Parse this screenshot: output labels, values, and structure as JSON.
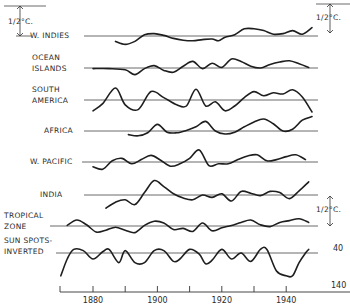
{
  "chart_data": {
    "type": "line",
    "title": "",
    "xlabel": "",
    "ylabel": "",
    "xlim": [
      1870,
      1960
    ],
    "x_ticks": [
      1880,
      1890,
      1900,
      1910,
      1920,
      1930,
      1940
    ],
    "x_tick_labels": [
      "1880",
      "1900",
      "1920",
      "1940"
    ],
    "scale_annotations": [
      {
        "text": "1/2°C.",
        "position": "top-left"
      },
      {
        "text": "1/2°C.",
        "position": "top-right"
      },
      {
        "text": "1/2°C.",
        "position": "right-lower"
      }
    ],
    "sunspot_scale": {
      "top_label": "40",
      "bottom_label": "140"
    },
    "units_per_half_degree": 1,
    "series": [
      {
        "name": "W. INDIES",
        "label_lines": [
          "W. INDIES"
        ],
        "x": [
          1887,
          1890,
          1893,
          1896,
          1899,
          1902,
          1905,
          1908,
          1911,
          1914,
          1917,
          1919,
          1921,
          1924,
          1927,
          1930,
          1933,
          1936,
          1939,
          1942,
          1945,
          1948
        ],
        "values": [
          -0.45,
          -0.7,
          -0.45,
          0.1,
          0.2,
          0.05,
          -0.2,
          -0.35,
          -0.4,
          -0.3,
          -0.25,
          -0.4,
          -0.1,
          0.1,
          0.6,
          0.6,
          0.45,
          0.15,
          0.2,
          0.45,
          0.15,
          0.7
        ]
      },
      {
        "name": "OCEAN ISLANDS",
        "label_lines": [
          "OCEAN",
          "ISLANDS"
        ],
        "x": [
          1880,
          1885,
          1890,
          1893,
          1896,
          1899,
          1902,
          1905,
          1908,
          1911,
          1914,
          1917,
          1920,
          1923,
          1926,
          1929,
          1932,
          1935,
          1938,
          1941,
          1944,
          1947
        ],
        "values": [
          -0.05,
          -0.05,
          -0.15,
          -0.55,
          -0.05,
          0.2,
          -0.2,
          -0.35,
          0.15,
          0.55,
          -0.05,
          0.4,
          0.05,
          0.75,
          0.55,
          0.15,
          0.0,
          0.3,
          0.5,
          0.6,
          0.35,
          0.05
        ]
      },
      {
        "name": "SOUTH AMERICA",
        "label_lines": [
          "SOUTH",
          "AMERICA"
        ],
        "x": [
          1880,
          1883,
          1887,
          1890,
          1894,
          1898,
          1902,
          1906,
          1909,
          1912,
          1915,
          1918,
          1921,
          1924,
          1927,
          1930,
          1933,
          1936,
          1939,
          1942,
          1945,
          1948
        ],
        "values": [
          -0.9,
          -0.3,
          1.0,
          -0.4,
          -0.8,
          0.7,
          0.2,
          -0.4,
          -0.5,
          0.9,
          -0.5,
          -0.15,
          -0.9,
          -0.5,
          0.2,
          0.7,
          0.35,
          0.6,
          0.5,
          0.85,
          0.25,
          -1.0
        ]
      },
      {
        "name": "AFRICA",
        "label_lines": [
          "AFRICA"
        ],
        "x": [
          1891,
          1894,
          1897,
          1900,
          1903,
          1906,
          1909,
          1912,
          1915,
          1918,
          1921,
          1924,
          1927,
          1930,
          1933,
          1936,
          1939,
          1942,
          1945,
          1948
        ],
        "values": [
          -0.3,
          -0.4,
          -0.15,
          0.55,
          -0.1,
          -0.15,
          0.05,
          0.35,
          0.8,
          0.0,
          -0.25,
          -0.1,
          0.35,
          0.75,
          1.0,
          0.6,
          0.0,
          0.15,
          0.9,
          1.2
        ]
      },
      {
        "name": "W. PACIFIC",
        "label_lines": [
          "W. PACIFIC"
        ],
        "x": [
          1880,
          1883,
          1886,
          1889,
          1892,
          1895,
          1898,
          1901,
          1904,
          1907,
          1910,
          1913,
          1916,
          1919,
          1922,
          1925,
          1928,
          1931,
          1934,
          1937,
          1940,
          1943,
          1946
        ],
        "values": [
          -0.4,
          -0.6,
          0.1,
          0.3,
          -0.15,
          0.2,
          0.55,
          0.15,
          -0.35,
          -0.15,
          0.3,
          1.0,
          -0.3,
          -0.15,
          -0.15,
          0.2,
          0.5,
          0.6,
          0.1,
          0.2,
          0.45,
          0.6,
          0.2
        ]
      },
      {
        "name": "INDIA",
        "label_lines": [
          "INDIA"
        ],
        "x": [
          1884,
          1887,
          1890,
          1893,
          1896,
          1899,
          1902,
          1905,
          1908,
          1911,
          1914,
          1917,
          1920,
          1923,
          1926,
          1929,
          1932,
          1935,
          1938,
          1941,
          1944,
          1947
        ],
        "values": [
          -1.1,
          -0.6,
          -0.4,
          -0.8,
          0.2,
          1.2,
          0.7,
          0.1,
          -0.25,
          -0.4,
          0.0,
          -0.2,
          0.1,
          -0.5,
          0.3,
          0.15,
          -0.05,
          0.3,
          0.2,
          -0.3,
          0.35,
          1.1
        ]
      },
      {
        "name": "TROPICAL ZONE",
        "label_lines": [
          "TROPICAL",
          "ZONE"
        ],
        "x": [
          1872,
          1875,
          1878,
          1881,
          1884,
          1887,
          1890,
          1893,
          1896,
          1899,
          1902,
          1905,
          1908,
          1911,
          1914,
          1917,
          1920,
          1923,
          1926,
          1929,
          1932,
          1935,
          1938,
          1941,
          1944,
          1947
        ],
        "values": [
          0.05,
          0.5,
          0.1,
          -0.5,
          -0.35,
          -0.1,
          -0.35,
          -0.55,
          0.05,
          0.4,
          0.25,
          -0.3,
          -0.2,
          -0.45,
          0.25,
          -0.4,
          -0.15,
          0.05,
          0.3,
          0.5,
          0.1,
          -0.05,
          0.3,
          0.45,
          0.6,
          0.3
        ]
      },
      {
        "name": "SUN SPOTS-INVERTED",
        "label_lines": [
          "SUN SPOTS-",
          "INVERTED"
        ],
        "x": [
          1870,
          1872,
          1874,
          1877,
          1880,
          1883,
          1885,
          1888,
          1890,
          1893,
          1896,
          1899,
          1902,
          1905,
          1907,
          1910,
          1913,
          1915,
          1917,
          1920,
          1923,
          1926,
          1929,
          1932,
          1934,
          1937,
          1940,
          1942,
          1944,
          1946,
          1947
        ],
        "values": [
          -1.9,
          -0.5,
          0.3,
          0.2,
          -0.5,
          0.1,
          0.3,
          -0.8,
          0.2,
          -0.8,
          -0.8,
          0.2,
          0.2,
          -0.7,
          -0.5,
          0.3,
          -0.1,
          -0.9,
          -0.6,
          0.3,
          -0.5,
          0.0,
          -0.7,
          0.3,
          0.3,
          -1.5,
          -1.9,
          -1.9,
          -0.8,
          0.0,
          0.3
        ]
      }
    ]
  }
}
